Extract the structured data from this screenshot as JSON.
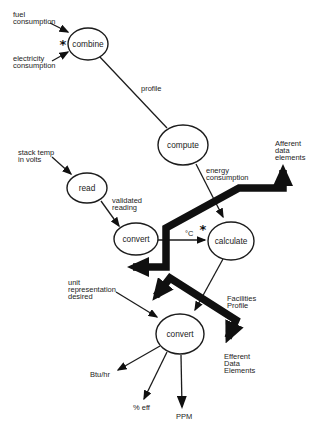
{
  "colors": {
    "ink": "#1c1c1c",
    "thick_ink": "#101010",
    "background": "#ffffff"
  },
  "canvas": {
    "width": 313,
    "height": 427
  },
  "glyphs": {
    "central_transform_marker": "*"
  },
  "diagram": {
    "nodes": [
      {
        "id": "combine",
        "label": "combine",
        "cx": 88,
        "cy": 44,
        "rx": 20,
        "ry": 16,
        "star": true,
        "star_x": 63,
        "star_y": 49
      },
      {
        "id": "compute",
        "label": "compute",
        "cx": 183,
        "cy": 145,
        "rx": 25,
        "ry": 20,
        "star": false
      },
      {
        "id": "read",
        "label": "read",
        "cx": 87,
        "cy": 188,
        "rx": 20,
        "ry": 15,
        "star": false
      },
      {
        "id": "convert-mid",
        "label": "convert",
        "cx": 136,
        "cy": 239,
        "rx": 22,
        "ry": 16,
        "star": false
      },
      {
        "id": "calculate",
        "label": "calculate",
        "cx": 231,
        "cy": 241,
        "rx": 23,
        "ry": 19,
        "star": true,
        "star_x": 203,
        "star_y": 234
      },
      {
        "id": "convert-bottom",
        "label": "convert",
        "cx": 180,
        "cy": 334,
        "rx": 24,
        "ry": 20,
        "star": false
      }
    ],
    "flows": [
      {
        "id": "fuel-consumption",
        "points": [
          [
            50,
            23
          ],
          [
            68,
            32
          ]
        ],
        "arrow": true,
        "big_head": false
      },
      {
        "id": "electricity-consumption",
        "points": [
          [
            52,
            61
          ],
          [
            68,
            52
          ]
        ],
        "arrow": true,
        "big_head": false
      },
      {
        "id": "profile",
        "points": [
          [
            99,
            56
          ],
          [
            167,
            128
          ]
        ],
        "arrow": false,
        "big_head": false
      },
      {
        "id": "energy-consumption",
        "points": [
          [
            196,
            164
          ],
          [
            223,
            217
          ]
        ],
        "arrow": true,
        "big_head": false
      },
      {
        "id": "stack-temp",
        "points": [
          [
            52,
            157
          ],
          [
            71,
            174
          ]
        ],
        "arrow": true,
        "big_head": false
      },
      {
        "id": "validated-reading",
        "points": [
          [
            101,
            201
          ],
          [
            119,
            226
          ]
        ],
        "arrow": true,
        "big_head": false
      },
      {
        "id": "deg-c",
        "points": [
          [
            158,
            240
          ],
          [
            205,
            240
          ]
        ],
        "arrow": true,
        "big_head": false
      },
      {
        "id": "facilities-profile",
        "points": [
          [
            223,
            259
          ],
          [
            195,
            310
          ]
        ],
        "arrow": true,
        "big_head": false
      },
      {
        "id": "unit-representation",
        "points": [
          [
            116,
            292
          ],
          [
            157,
            317
          ]
        ],
        "arrow": true,
        "big_head": false
      },
      {
        "id": "btu-per-hr",
        "points": [
          [
            160,
            346
          ],
          [
            118,
            370
          ]
        ],
        "arrow": true,
        "big_head": false
      },
      {
        "id": "pct-eff",
        "points": [
          [
            167,
            352
          ],
          [
            144,
            399
          ]
        ],
        "arrow": true,
        "big_head": false
      },
      {
        "id": "ppm",
        "points": [
          [
            181,
            355
          ],
          [
            182,
            407
          ]
        ],
        "arrow": true,
        "big_head": true
      }
    ],
    "boundary_markers": [
      {
        "id": "afferent-boundary",
        "points": [
          [
            133,
            267
          ],
          [
            166,
            267
          ],
          [
            166,
            228
          ],
          [
            239,
            188
          ],
          [
            283,
            188
          ],
          [
            283,
            170
          ]
        ]
      },
      {
        "id": "efferent-boundary",
        "points": [
          [
            156,
            296
          ],
          [
            170,
            278
          ],
          [
            236,
            320
          ],
          [
            228,
            338
          ]
        ]
      }
    ],
    "annotations": [
      {
        "id": "fuel-consumption-label",
        "lines": [
          "fuel",
          "consumption"
        ],
        "x": 13,
        "y": 10
      },
      {
        "id": "electricity-consumption-label",
        "lines": [
          "electricity",
          "consumption"
        ],
        "x": 13,
        "y": 54
      },
      {
        "id": "profile-label",
        "lines": [
          "profile"
        ],
        "x": 141,
        "y": 84
      },
      {
        "id": "energy-consumption-label",
        "lines": [
          "energy",
          "consumption"
        ],
        "x": 206,
        "y": 166
      },
      {
        "id": "afferent-data-elements-label",
        "lines": [
          "Afferent",
          "data",
          "elements"
        ],
        "x": 275,
        "y": 139
      },
      {
        "id": "stack-temp-label",
        "lines": [
          "stack temp",
          "in volts"
        ],
        "x": 18,
        "y": 148
      },
      {
        "id": "validated-reading-label",
        "lines": [
          "validated",
          "reading"
        ],
        "x": 112,
        "y": 196
      },
      {
        "id": "deg-c-label",
        "lines": [
          "°C"
        ],
        "x": 185,
        "y": 229
      },
      {
        "id": "facilities-profile-label",
        "lines": [
          "Facilities",
          "Profile"
        ],
        "x": 227,
        "y": 294
      },
      {
        "id": "unit-representation-label",
        "lines": [
          "unit",
          "representation",
          "desired"
        ],
        "x": 68,
        "y": 278
      },
      {
        "id": "efferent-data-elements-label",
        "lines": [
          "Efferent",
          "Data",
          "Elements"
        ],
        "x": 224,
        "y": 352
      },
      {
        "id": "btu-per-hr-label",
        "lines": [
          "Btu/hr"
        ],
        "x": 90,
        "y": 370
      },
      {
        "id": "pct-eff-label",
        "lines": [
          "% eff"
        ],
        "x": 133,
        "y": 403
      },
      {
        "id": "ppm-label",
        "lines": [
          "PPM"
        ],
        "x": 176,
        "y": 412
      }
    ]
  }
}
